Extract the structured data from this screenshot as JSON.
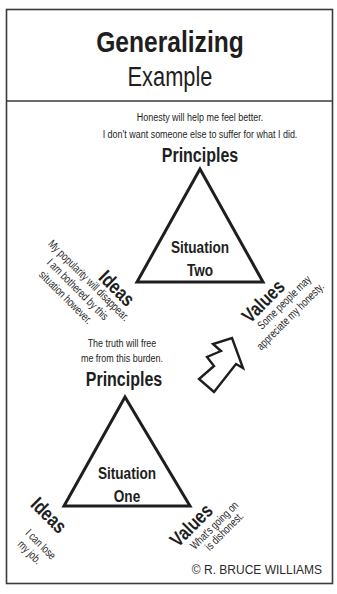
{
  "header": {
    "title": "Generalizing",
    "subtitle": "Example"
  },
  "situation_two": {
    "label_line1": "Situation",
    "label_line2": "Two",
    "principles": {
      "heading": "Principles",
      "line1": "Honesty will help me feel better.",
      "line2": "I don't want someone else to suffer for what I did."
    },
    "ideas": {
      "heading": "Ideas",
      "line1": "My popularity will disappear.",
      "line2": "I am bothered by this",
      "line3": "situation however."
    },
    "values": {
      "heading": "Values",
      "line1": "Some people may",
      "line2": "appreciate my honesty."
    }
  },
  "situation_one": {
    "label_line1": "Situation",
    "label_line2": "One",
    "principles": {
      "heading": "Principles",
      "line1": "The truth will free",
      "line2": "me from this burden."
    },
    "ideas": {
      "heading": "Ideas",
      "line1": "I can lose",
      "line2": "my job."
    },
    "values": {
      "heading": "Values",
      "line1": "What's going on",
      "line2": "is dishonest."
    }
  },
  "arrow": {
    "icon": "up-right-arrow-icon",
    "direction": "up-right"
  },
  "copyright": "© R. BRUCE WILLIAMS",
  "colors": {
    "ink": "#1e1e1e",
    "border": "#3a3a3a",
    "background": "#ffffff"
  }
}
